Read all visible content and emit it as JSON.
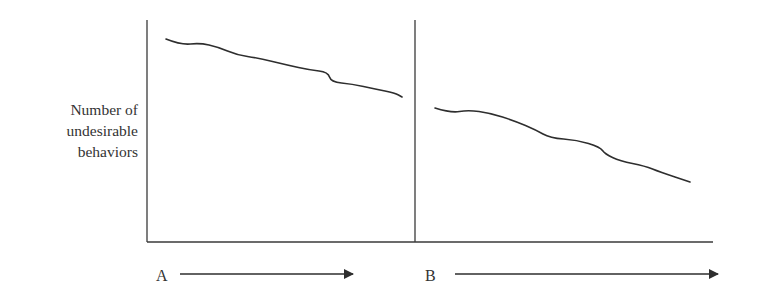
{
  "chart_data": {
    "type": "line",
    "title": "",
    "xlabel": "",
    "ylabel": "Number of undesirable behaviors",
    "ylabel_lines": [
      "Number of",
      "undesirable",
      "behaviors"
    ],
    "grid": false,
    "legend": null,
    "phases": [
      {
        "name": "A",
        "description": "Baseline / phase A",
        "trend": "decreasing",
        "points": [
          [
            166,
            39
          ],
          [
            181,
            45
          ],
          [
            200,
            43
          ],
          [
            218,
            47
          ],
          [
            237,
            55
          ],
          [
            258,
            58
          ],
          [
            287,
            65
          ],
          [
            310,
            70
          ],
          [
            328,
            72
          ],
          [
            331,
            82
          ],
          [
            352,
            84
          ],
          [
            375,
            89
          ],
          [
            395,
            93
          ],
          [
            402,
            97
          ]
        ]
      },
      {
        "name": "B",
        "description": "Intervention / phase B",
        "trend": "decreasing",
        "points": [
          [
            435,
            108
          ],
          [
            451,
            113
          ],
          [
            468,
            110
          ],
          [
            490,
            113
          ],
          [
            515,
            121
          ],
          [
            536,
            130
          ],
          [
            550,
            138
          ],
          [
            577,
            140
          ],
          [
            600,
            147
          ],
          [
            605,
            154
          ],
          [
            620,
            161
          ],
          [
            645,
            166
          ],
          [
            660,
            172
          ],
          [
            690,
            182
          ]
        ]
      }
    ],
    "phase_labels": [
      "A",
      "B"
    ],
    "phase_divider": true,
    "axes": {
      "y_axis": {
        "x": 147,
        "y_top": 20,
        "y_bottom": 242,
        "ticks": []
      },
      "x_axis": {
        "y": 242,
        "x_left": 147,
        "x_right": 713,
        "ticks": []
      },
      "divider": {
        "x": 415,
        "y_top": 20,
        "y_bottom": 242
      }
    },
    "arrows": [
      {
        "label": "A",
        "x_start": 180,
        "x_end": 355,
        "y": 274
      },
      {
        "label": "B",
        "x_start": 455,
        "x_end": 720,
        "y": 274
      }
    ],
    "colors": {
      "line": "#2e2e2e",
      "axis": "#3a3a3a",
      "text": "#333333",
      "background": "#ffffff"
    }
  },
  "labels": {
    "ylabel_line1": "Number of",
    "ylabel_line2": "undesirable",
    "ylabel_line3": "behaviors",
    "phase_a": "A",
    "phase_b": "B"
  }
}
